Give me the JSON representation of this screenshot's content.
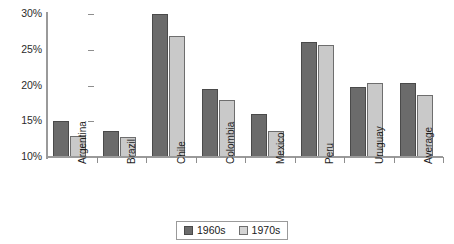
{
  "chart_data": {
    "type": "bar",
    "title": "",
    "xlabel": "",
    "ylabel": "",
    "ylim": [
      10,
      30
    ],
    "ytick_values": [
      10,
      15,
      20,
      25,
      30
    ],
    "ytick_labels": [
      "10%",
      "15%",
      "20%",
      "25%",
      "30%"
    ],
    "grid": false,
    "legend_position": "bottom-center",
    "categories": [
      "Argentina",
      "Brazil",
      "Chile",
      "Colombia",
      "Mexico",
      "Peru",
      "Uruguay",
      "Average"
    ],
    "series": [
      {
        "name": "1960s",
        "color": "#6b6b6b",
        "values": [
          15.0,
          13.7,
          30.0,
          19.5,
          16.0,
          26.1,
          19.8,
          20.4
        ]
      },
      {
        "name": "1970s",
        "color": "#c9c9c9",
        "values": [
          13.0,
          12.8,
          26.9,
          18.0,
          13.7,
          25.7,
          20.3,
          18.7
        ]
      }
    ]
  },
  "legend": {
    "items": [
      {
        "label": "1960s",
        "swatch": "series-1960s-swatch"
      },
      {
        "label": "1970s",
        "swatch": "series-1970s-swatch"
      }
    ]
  }
}
